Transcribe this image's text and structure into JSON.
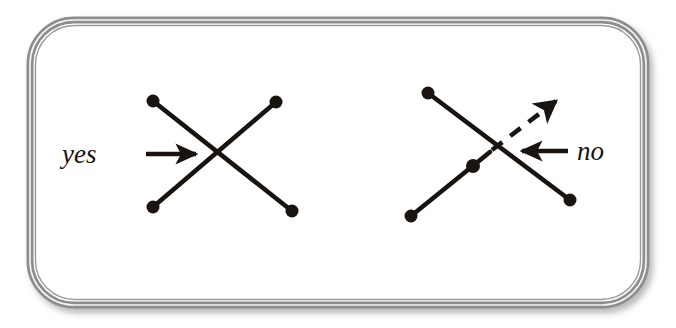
{
  "figure": {
    "background_color": "#ffffff",
    "frame": {
      "name": "rounded-frame",
      "x": 30,
      "y": 20,
      "width": 616,
      "height": 285,
      "corner_radius": 44,
      "border_color": "#8d8d8d",
      "inner_line_color": "#f2f2f2",
      "fill_color": "#ffffff",
      "shadow_color": "#c9c9c9"
    },
    "ink_color": "#1a1410",
    "panels": [
      {
        "id": "yes-panel",
        "label": "yes",
        "label_x": 62,
        "label_y": 163,
        "verdict": "valid",
        "pointer": {
          "name": "yes-pointer-arrow",
          "direction": "right",
          "x1": 146,
          "y1": 154,
          "x2": 202,
          "y2": 154,
          "style": "solid"
        },
        "strands": [
          {
            "name": "strand-descending",
            "style": "solid",
            "from": {
              "x": 153,
              "y": 101
            },
            "to": {
              "x": 292,
              "y": 211
            },
            "dot_start": true,
            "dot_end": true
          },
          {
            "name": "strand-ascending",
            "style": "solid",
            "from": {
              "x": 153,
              "y": 207
            },
            "to": {
              "x": 276,
              "y": 102
            },
            "dot_start": true,
            "dot_end": true
          }
        ],
        "crossing": {
          "x": 223,
          "y": 155,
          "type": "clean"
        }
      },
      {
        "id": "no-panel",
        "label": "no",
        "label_x": 577,
        "label_y": 160,
        "verdict": "invalid",
        "pointer": {
          "name": "no-pointer-arrow",
          "direction": "left",
          "x1": 568,
          "y1": 151,
          "x2": 516,
          "y2": 151,
          "style": "solid"
        },
        "strands": [
          {
            "name": "strand-descending",
            "style": "solid",
            "from": {
              "x": 428,
              "y": 93
            },
            "to": {
              "x": 570,
              "y": 200
            },
            "dot_start": true,
            "dot_end": true
          },
          {
            "name": "strand-ascending-solid",
            "style": "solid",
            "from": {
              "x": 411,
              "y": 216
            },
            "to": {
              "x": 490,
              "y": 152
            },
            "dot_start": true,
            "dot_end": false,
            "dot_mid": {
              "x": 473,
              "y": 166
            }
          },
          {
            "name": "strand-ascending-dashed",
            "style": "dashed",
            "from": {
              "x": 492,
              "y": 150
            },
            "to": {
              "x": 562,
              "y": 96
            },
            "dash_pattern": "13 10",
            "arrowhead": true
          }
        ],
        "crossing": {
          "x": 500,
          "y": 145,
          "type": "ambiguous"
        }
      }
    ],
    "dot_radius": 6.5,
    "stroke_width": 4.6
  }
}
